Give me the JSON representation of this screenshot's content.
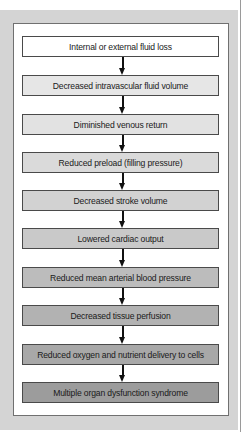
{
  "figure": {
    "type": "flowchart",
    "direction": "top-to-bottom",
    "steps": [
      {
        "label": "Internal or external fluid loss",
        "fill": "#ffffff"
      },
      {
        "label": "Decreased intravascular fluid volume",
        "fill": "#e6e6e6"
      },
      {
        "label": "Diminished venous return",
        "fill": "#e2e2e2"
      },
      {
        "label": "Reduced preload (filling pressure)",
        "fill": "#dadada"
      },
      {
        "label": "Decreased stroke volume",
        "fill": "#d2d2d2"
      },
      {
        "label": "Lowered cardiac output",
        "fill": "#c9c9c9"
      },
      {
        "label": "Reduced mean arterial blood pressure",
        "fill": "#bcbcbc"
      },
      {
        "label": "Decreased tissue perfusion",
        "fill": "#b2b2b2"
      },
      {
        "label": "Reduced oxygen and nutrient delivery to cells",
        "fill": "#a8a8a8"
      },
      {
        "label": "Multiple organ dysfunction syndrome",
        "fill": "#9c9c9c"
      }
    ],
    "colors": {
      "frame": "#d4d4d4",
      "panel": "#ffffff",
      "border": "#4a4a4a",
      "arrow": "#111111"
    }
  }
}
